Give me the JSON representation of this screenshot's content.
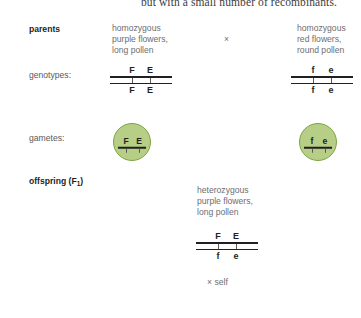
{
  "page": {
    "top_running_text": "but with a small number of recombinants.",
    "colors": {
      "gamete_fill": "#b6ce85",
      "gamete_border": "#7da442",
      "text": "#6d6e71",
      "heading": "#231f20",
      "chromosome": "#231f20"
    }
  },
  "rows": {
    "parents": {
      "label": "parents",
      "cross_symbol": "×",
      "left": {
        "line1": "homozygous",
        "line2": "purple flowers,",
        "line3": "long pollen"
      },
      "right": {
        "line1": "homozygous",
        "line2": "red flowers,",
        "line3": "round pollen"
      }
    },
    "genotypes": {
      "label": "genotypes:",
      "left": {
        "top_alleles": [
          "F",
          "E"
        ],
        "bottom_alleles": [
          "F",
          "E"
        ]
      },
      "right": {
        "top_alleles": [
          "f",
          "e"
        ],
        "bottom_alleles": [
          "f",
          "e"
        ]
      }
    },
    "gametes": {
      "label": "gametes:",
      "left": {
        "alleles": [
          "F",
          "E"
        ]
      },
      "right": {
        "alleles": [
          "f",
          "e"
        ]
      }
    },
    "offspring": {
      "label_prefix": "offspring (F",
      "label_subscript": "1",
      "label_suffix": ")",
      "description": {
        "line1": "heterozygous",
        "line2": "purple flowers,",
        "line3": "long pollen"
      },
      "genotype": {
        "top_alleles": [
          "F",
          "E"
        ],
        "bottom_alleles": [
          "f",
          "e"
        ]
      },
      "self_cross_note": "× self"
    }
  }
}
